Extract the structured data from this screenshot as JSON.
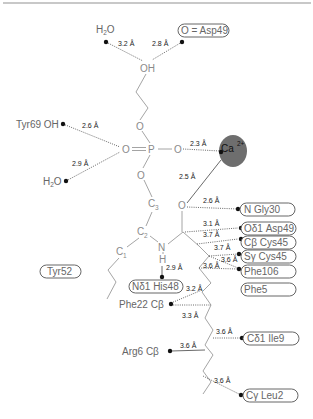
{
  "diagram": {
    "type": "ligand-binding-site-schematic",
    "ligand_atoms": {
      "hydroxyl": "OH",
      "ether_o1": "O",
      "phosphate_o_double": "O",
      "phosphorus": "P",
      "phosphate_o_ca": "O",
      "ether_o2": "O",
      "c3": "C",
      "c3_sub": "3",
      "c2": "C",
      "c2_sub": "2",
      "c1": "C",
      "c1_sub": "1",
      "carbonyl_o": "O",
      "amide_n": "N",
      "amide_h": "H"
    },
    "metal": {
      "label": "Ca",
      "charge": "2+",
      "color": "#6e6e6e"
    },
    "contacts": [
      {
        "id": "h2o_top",
        "partner": "H2O",
        "distance": "3.2 Å"
      },
      {
        "id": "asp49_o",
        "partner": "O=Asp49",
        "distance": "2.8 Å",
        "boxed": true
      },
      {
        "id": "tyr69",
        "partner": "Tyr69 OH",
        "distance": "2.6 Å"
      },
      {
        "id": "h2o_low",
        "partner": "H2O",
        "distance": "2.9 Å"
      },
      {
        "id": "ca_o",
        "partner": "Ca2+",
        "distance": "2.3 Å"
      },
      {
        "id": "ca_carbonyl",
        "partner": "Ca2+",
        "distance": "2.5 Å"
      },
      {
        "id": "gly30",
        "partner": "N Gly30",
        "distance": "2.6 Å",
        "boxed": true
      },
      {
        "id": "asp49_od1",
        "partner": "Oδ1 Asp49",
        "distance": "3.1 Å",
        "boxed": true
      },
      {
        "id": "cys45_cb",
        "partner": "Cβ Cys45",
        "distance": "3.7 Å",
        "boxed": true
      },
      {
        "id": "cys45_sg",
        "partner": "Sγ Cys45",
        "distance": "3.7 Å",
        "boxed": true
      },
      {
        "id": "phe106_a",
        "partner": "Phe106",
        "distance": "3.6 Å",
        "boxed": true
      },
      {
        "id": "phe106_b",
        "partner": "Phe106",
        "distance": "3.6 Å",
        "boxed": true
      },
      {
        "id": "his48",
        "partner": "Nδ1 His48",
        "distance": "2.9 Å",
        "boxed": true
      },
      {
        "id": "phe22_a",
        "partner": "Phe22 Cβ",
        "distance": "3.2 Å"
      },
      {
        "id": "phe22_b",
        "partner": "Phe22 Cβ",
        "distance": "3.3 Å"
      },
      {
        "id": "ile9",
        "partner": "Cδ1 Ile9",
        "distance": "3.6 Å",
        "boxed": true
      },
      {
        "id": "arg6",
        "partner": "Arg6 Cβ",
        "distance": "3.6 Å"
      },
      {
        "id": "leu2",
        "partner": "Cγ Leu2",
        "distance": "3.6 Å",
        "boxed": true
      }
    ],
    "labels": {
      "h2o_top": "H",
      "h2o_top_sub": "2",
      "h2o_top_o": "O",
      "asp49_o": "O = Asp49",
      "tyr69": "Tyr69 OH",
      "h2o_low": "H",
      "h2o_low_sub": "2",
      "h2o_low_o": "O",
      "gly30": "N Gly30",
      "asp49_od1": "Oδ1 Asp49",
      "cys45_cb": "Cβ Cys45",
      "cys45_sg": "Sγ Cys45",
      "phe106": "Phe106",
      "phe5": "Phe5",
      "tyr52": "Tyr52",
      "his48": "Nδ1 His48",
      "phe22": "Phe22 Cβ",
      "ile9": "Cδ1 Ile9",
      "arg6": "Arg6 Cβ",
      "leu2": "Cγ Leu2"
    },
    "distances": {
      "d_h2o_top": "3.2 Å",
      "d_asp49_o": "2.8 Å",
      "d_tyr69": "2.6 Å",
      "d_h2o_low": "2.9 Å",
      "d_ca_o": "2.3 Å",
      "d_ca_carbonyl": "2.5 Å",
      "d_gly30": "2.6 Å",
      "d_asp49_od1": "3.1 Å",
      "d_cys45_cb": "3.7 Å",
      "d_cys45_sg": "3.7 Å",
      "d_phe106_a": "3.6 Å",
      "d_phe106_b": "3.6 Å",
      "d_his48": "2.9 Å",
      "d_phe22_a": "3.2 Å",
      "d_phe22_b": "3.3 Å",
      "d_ile9": "3.6 Å",
      "d_arg6": "3.6 Å",
      "d_leu2": "3.6 Å"
    }
  }
}
